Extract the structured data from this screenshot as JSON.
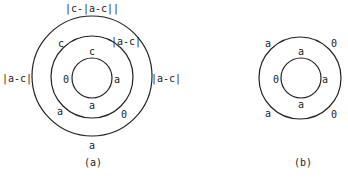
{
  "figure_a": {
    "caption": "(a)",
    "outer_ring": {
      "top": "|c-|a-c||",
      "left": "|a-c|",
      "right": "|a-c|",
      "bottom": "a"
    },
    "middle_ring": {
      "top_left": "c",
      "top_right": "|a-c|",
      "bottom_left": "a",
      "bottom_right": "0"
    },
    "inner_ring": {
      "top": "c",
      "left": "0",
      "right": "a",
      "bottom": "a"
    }
  },
  "figure_b": {
    "caption": "(b)",
    "outer_ring": {
      "top_left": "a",
      "top_right": "0",
      "bottom_left": "a",
      "bottom_right": "0"
    },
    "inner_ring": {
      "top": "a",
      "left": "0",
      "right": "a",
      "bottom": "a"
    }
  }
}
